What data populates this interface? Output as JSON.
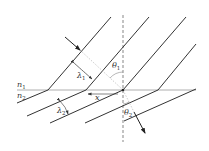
{
  "diagram": {
    "labels": {
      "n1": "n",
      "n1_sub": "1",
      "n2": "n",
      "n2_sub": "2",
      "lambda1": "λ",
      "lambda1_sub": "1",
      "lambda2": "λ",
      "lambda2_sub": "2",
      "theta1": "θ",
      "theta1_sub": "1",
      "theta2": "θ",
      "theta2_sub": "2",
      "x": "x"
    },
    "colors": {
      "line": "#333333",
      "interface": "#999999",
      "construction": "#aaaaaa"
    }
  }
}
